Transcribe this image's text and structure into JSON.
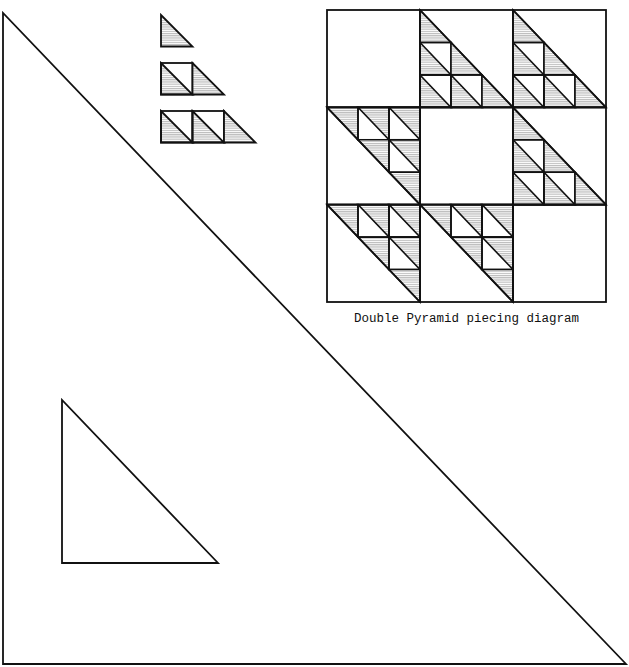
{
  "caption": "Double Pyramid piecing diagram",
  "colors": {
    "stroke": "#111111",
    "shade_line": "#9a9a9a",
    "background": "#ffffff"
  },
  "templates": {
    "large_triangle": {
      "points": [
        [
          3,
          13
        ],
        [
          3,
          664
        ],
        [
          626,
          664
        ]
      ]
    },
    "small_triangle": {
      "points": [
        [
          62,
          400
        ],
        [
          62,
          563
        ],
        [
          218,
          563
        ]
      ]
    }
  },
  "piecing_steps": [
    {
      "label": "step-1",
      "units": [
        "triangle"
      ]
    },
    {
      "label": "step-2",
      "units": [
        "square",
        "triangle"
      ]
    },
    {
      "label": "step-3",
      "units": [
        "square",
        "square",
        "triangle"
      ]
    }
  ],
  "piecing_steps_geometry": {
    "x": 161,
    "unit": 31.5,
    "rows_y": [
      15,
      63,
      111
    ]
  },
  "quilt_grid": {
    "x": 327,
    "y": 10,
    "width": 279,
    "height": 292,
    "rows": 3,
    "cols": 3,
    "layout": [
      [
        "empty",
        "A",
        "A"
      ],
      [
        "B",
        "empty",
        "A"
      ],
      [
        "B",
        "B",
        "empty"
      ]
    ],
    "block_types": {
      "A": {
        "description": "lower-left staircase of half-square triangles",
        "cells": [
          {
            "r": 0,
            "c": 0,
            "kind": "triangle"
          },
          {
            "r": 1,
            "c": 0,
            "kind": "square"
          },
          {
            "r": 1,
            "c": 1,
            "kind": "triangle"
          },
          {
            "r": 2,
            "c": 0,
            "kind": "square"
          },
          {
            "r": 2,
            "c": 1,
            "kind": "square"
          },
          {
            "r": 2,
            "c": 2,
            "kind": "triangle"
          }
        ]
      },
      "B": {
        "description": "upper-right staircase of half-square triangles",
        "cells": [
          {
            "r": 0,
            "c": 0,
            "kind": "triangle"
          },
          {
            "r": 0,
            "c": 1,
            "kind": "square"
          },
          {
            "r": 0,
            "c": 2,
            "kind": "square"
          },
          {
            "r": 1,
            "c": 1,
            "kind": "triangle"
          },
          {
            "r": 1,
            "c": 2,
            "kind": "square"
          },
          {
            "r": 2,
            "c": 2,
            "kind": "triangle"
          }
        ]
      }
    }
  }
}
